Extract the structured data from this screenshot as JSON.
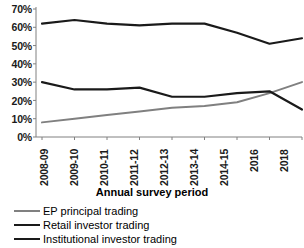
{
  "chart_data": {
    "type": "line",
    "title": "",
    "xlabel": "Annual survey period",
    "ylabel": "",
    "categories": [
      "2008-09",
      "2009-10",
      "2010-11",
      "2011-12",
      "2012-13",
      "2013-14",
      "2014-15",
      "2016",
      "2018"
    ],
    "ylim": [
      0,
      70
    ],
    "ytick_values": [
      0,
      10,
      20,
      30,
      40,
      50,
      60,
      70
    ],
    "ytick_labels": [
      "0%",
      "10%",
      "20%",
      "30%",
      "40%",
      "50%",
      "60%",
      "70%"
    ],
    "grid": false,
    "legend_position": "below",
    "series": [
      {
        "name": "EP principal trading",
        "color": "#808080",
        "width": 2,
        "values": [
          8,
          10,
          12,
          14,
          16,
          17,
          19,
          24,
          30
        ]
      },
      {
        "name": "Retail investor trading",
        "color": "#1a1a1a",
        "width": 2.2,
        "values": [
          30,
          26,
          26,
          27,
          22,
          22,
          24,
          25,
          15
        ]
      },
      {
        "name": "Institutional investor trading",
        "color": "#1a1a1a",
        "width": 2.2,
        "values": [
          62,
          64,
          62,
          61,
          62,
          62,
          57,
          51,
          54
        ]
      }
    ]
  },
  "axis": {
    "line_color": "#808080"
  }
}
